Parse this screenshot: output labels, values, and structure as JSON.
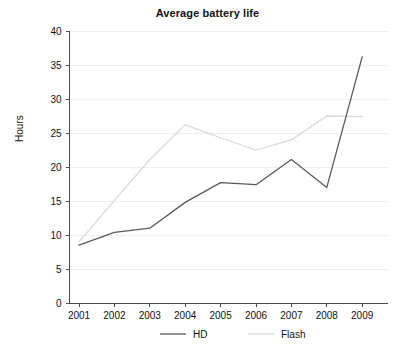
{
  "chart_data": {
    "type": "line",
    "title": "Average battery life",
    "xlabel": "",
    "ylabel": "Hours",
    "x": [
      "2001",
      "2002",
      "2003",
      "2004",
      "2005",
      "2006",
      "2007",
      "2008",
      "2009"
    ],
    "categories": [
      "2001",
      "2002",
      "2003",
      "2004",
      "2005",
      "2006",
      "2007",
      "2008",
      "2009"
    ],
    "series": [
      {
        "name": "HD",
        "color": "#595959",
        "values": [
          8.5,
          10.4,
          11.0,
          14.8,
          17.7,
          17.4,
          21.1,
          17.0,
          36.2
        ]
      },
      {
        "name": "Flash",
        "color": "#d9d9d9",
        "values": [
          9.0,
          15.1,
          21.1,
          26.2,
          24.3,
          22.5,
          24.0,
          27.5,
          27.4
        ]
      }
    ],
    "ylim": [
      0,
      40
    ],
    "yticks": [
      0,
      5,
      10,
      15,
      20,
      25,
      30,
      35,
      40
    ],
    "ytick_labels": [
      "0",
      "5",
      "10",
      "15",
      "20",
      "25",
      "30",
      "35",
      "40"
    ],
    "xtick_labels": [
      "2001",
      "2002",
      "2003",
      "2004",
      "2005",
      "2006",
      "2007",
      "2008",
      "2009"
    ],
    "grid": true,
    "grid_color": "#f0eef0",
    "legend_position": "bottom",
    "legend": [
      "HD",
      "Flash"
    ]
  },
  "legend": {
    "entries": [
      {
        "label": "HD",
        "color": "#595959"
      },
      {
        "label": "Flash",
        "color": "#d9d9d9"
      }
    ]
  },
  "axes": {
    "y_title": "Hours",
    "axis_color": "#4a4a4a"
  }
}
